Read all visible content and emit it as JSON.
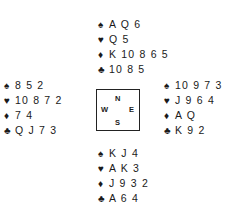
{
  "suits": {
    "spades": "♠",
    "hearts": "♥",
    "diamonds": "♦",
    "clubs": "♣"
  },
  "compass": {
    "north": "N",
    "south": "S",
    "east": "E",
    "west": "W"
  },
  "hands": {
    "north": {
      "spades": "A Q 6",
      "hearts": "Q 5",
      "diamonds": "K 10 8 6 5",
      "clubs": "10 8 5"
    },
    "west": {
      "spades": "8 5 2",
      "hearts": "10 8 7 2",
      "diamonds": "7 4",
      "clubs": "Q J 7 3"
    },
    "east": {
      "spades": "10 9 7 3",
      "hearts": "J 9 6 4",
      "diamonds": "A Q",
      "clubs": "K 9 2"
    },
    "south": {
      "spades": "K J 4",
      "hearts": "A K 3",
      "diamonds": "J 9 3 2",
      "clubs": "A 6 4"
    }
  }
}
